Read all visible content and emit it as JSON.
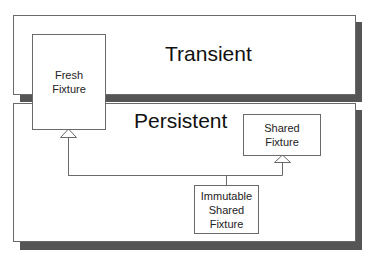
{
  "diagram": {
    "regions": [
      {
        "id": "transient",
        "label": "Transient"
      },
      {
        "id": "persistent",
        "label": "Persistent"
      }
    ],
    "nodes": [
      {
        "id": "fresh",
        "label_line1": "Fresh",
        "label_line2": "Fixture"
      },
      {
        "id": "shared",
        "label_line1": "Shared",
        "label_line2": "Fixture"
      },
      {
        "id": "immutable",
        "label_line1": "Immutable",
        "label_line2": "Shared",
        "label_line3": "Fixture"
      }
    ],
    "edges": [
      {
        "from": "immutable",
        "to": "fresh",
        "type": "generalization"
      },
      {
        "from": "immutable",
        "to": "shared",
        "type": "generalization"
      }
    ],
    "colors": {
      "shadow": "#555555",
      "border": "#6a6a6a",
      "background": "#ffffff"
    }
  }
}
